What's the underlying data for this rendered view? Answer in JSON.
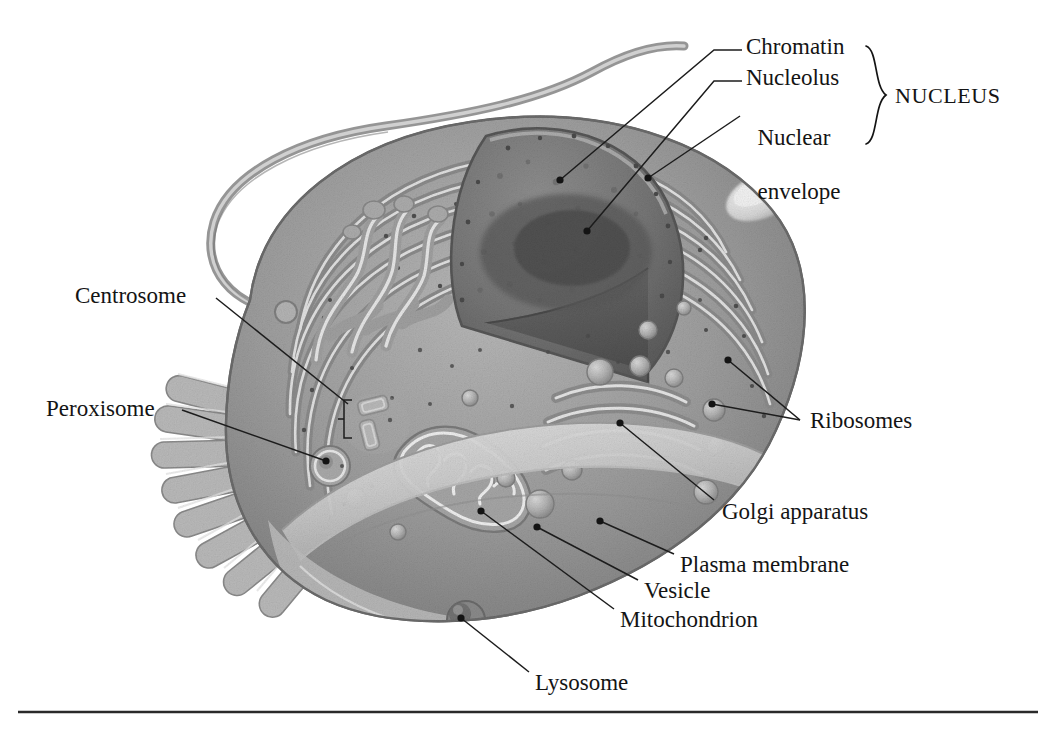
{
  "figure": {
    "kind": "animal-cell-anatomy-diagram",
    "title_visible": false,
    "style": "grayscale halftone scanned textbook illustration",
    "group_label": "NUCLEUS",
    "baseline_rule": true
  },
  "palette": {
    "page_background": "#ffffff",
    "ink": "#141414",
    "leader_line": "#1c1c1c",
    "cytoplasm_mid": "#9a9a9a",
    "cytoplasm_light": "#c9c9c9",
    "cytoplasm_dark": "#6f6f6f",
    "membrane_pale": "#d8d8d8",
    "nucleus_fill": "#7c7c7c",
    "nucleus_cut": "#5e5e5e",
    "highlight": "#ececec",
    "rule": "#2a2a2a"
  },
  "labels": [
    {
      "id": "chromatin",
      "text": "Chromatin",
      "x": 746,
      "y": 45,
      "target_x": 560,
      "target_y": 180,
      "elbow_x": 716,
      "elbow_y": 56,
      "dot": true,
      "lines": 1
    },
    {
      "id": "nucleolus",
      "text": "Nucleolus",
      "x": 746,
      "y": 76,
      "target_x": 587,
      "target_y": 231,
      "elbow_x": 716,
      "elbow_y": 87,
      "dot": true,
      "lines": 1
    },
    {
      "id": "nuclear-envelope",
      "text": "Nuclear\nenvelope",
      "x": 746,
      "y": 108,
      "target_x": 648,
      "target_y": 178,
      "elbow_x": 735,
      "elbow_y": 119,
      "dot": true,
      "lines": 2
    },
    {
      "id": "nucleus-group",
      "text": "NUCLEUS",
      "x": 893,
      "y": 83,
      "target_x": null,
      "target_y": null,
      "elbow_x": null,
      "elbow_y": null,
      "dot": false,
      "lines": 1
    },
    {
      "id": "centrosome",
      "text": "Centrosome",
      "x": 75,
      "y": 283,
      "target_x": 350,
      "target_y": 419,
      "elbow_x": 222,
      "elbow_y": 300,
      "dot": false,
      "lines": 1
    },
    {
      "id": "peroxisome",
      "text": "Peroxisome",
      "x": 46,
      "y": 396,
      "target_x": 326,
      "target_y": 461,
      "elbow_x": 188,
      "elbow_y": 412,
      "dot": true,
      "lines": 1
    },
    {
      "id": "ribosomes",
      "text": "Ribosomes",
      "x": 810,
      "y": 410,
      "target_x": 728,
      "target_y": 360,
      "elbow_x": 800,
      "elbow_y": 422,
      "dot": true,
      "lines": 1
    },
    {
      "id": "ribosomes-2",
      "text": "",
      "x": 810,
      "y": 410,
      "target_x": 712,
      "target_y": 404,
      "elbow_x": 800,
      "elbow_y": 422,
      "dot": true,
      "lines": 1
    },
    {
      "id": "golgi-apparatus",
      "text": "Golgi apparatus",
      "x": 722,
      "y": 500,
      "target_x": 620,
      "target_y": 423,
      "elbow_x": 712,
      "elbow_y": 503,
      "dot": true,
      "lines": 1
    },
    {
      "id": "plasma-membrane",
      "text": "Plasma membrane",
      "x": 680,
      "y": 554,
      "target_x": 600,
      "target_y": 521,
      "elbow_x": 672,
      "elbow_y": 557,
      "dot": true,
      "lines": 1
    },
    {
      "id": "vesicle",
      "text": "Vesicle",
      "x": 644,
      "y": 580,
      "target_x": 537,
      "target_y": 527,
      "elbow_x": 636,
      "elbow_y": 583,
      "dot": true,
      "lines": 1
    },
    {
      "id": "mitochondrion",
      "text": "Mitochondrion",
      "x": 620,
      "y": 609,
      "target_x": 481,
      "target_y": 511,
      "elbow_x": 612,
      "elbow_y": 612,
      "dot": true,
      "lines": 1
    },
    {
      "id": "lysosome",
      "text": "Lysosome",
      "x": 535,
      "y": 672,
      "target_x": 461,
      "target_y": 618,
      "elbow_x": 527,
      "elbow_y": 675,
      "dot": true,
      "lines": 1
    }
  ],
  "organelles": [
    {
      "name": "nucleus",
      "description": "large cut-away sphere, upper centre of cell"
    },
    {
      "name": "nucleolus",
      "description": "dark mass inside nucleus"
    },
    {
      "name": "chromatin",
      "description": "granular texture filling nucleus"
    },
    {
      "name": "nuclear-envelope",
      "description": "double membrane with pores at nucleus rim"
    },
    {
      "name": "rough-endoplasmic-reticulum",
      "description": "concentric ribbon cisternae around nucleus"
    },
    {
      "name": "smooth-endoplasmic-reticulum",
      "description": "branching tubules upper left of cell"
    },
    {
      "name": "golgi-apparatus",
      "description": "stacked flattened sacs lower right"
    },
    {
      "name": "mitochondrion",
      "description": "bean shape with internal cristae, lower centre"
    },
    {
      "name": "lysosome",
      "description": "small dark sphere on membrane fold, bottom"
    },
    {
      "name": "peroxisome",
      "description": "small round body left of centre"
    },
    {
      "name": "centrosome",
      "description": "paired centrioles, bracketed, mid-left"
    },
    {
      "name": "vesicles",
      "description": "small spheres scattered in cytosol"
    },
    {
      "name": "ribosomes",
      "description": "dark dots on ER surface and free in cytosol"
    },
    {
      "name": "plasma-membrane",
      "description": "outer boundary, cut away at lower right"
    },
    {
      "name": "microvilli",
      "description": "finger-like projections along lower left edge"
    },
    {
      "name": "flagellum",
      "description": "long whip-like tail sweeping up and right"
    }
  ]
}
